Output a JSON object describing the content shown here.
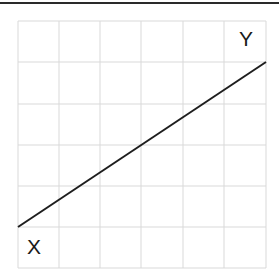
{
  "diagram": {
    "labels": {
      "start": "X",
      "end": "Y"
    },
    "grid": {
      "columns": 6,
      "rows": 6,
      "line_color": "#d9d9d9"
    },
    "line": {
      "color": "#1e1e1e",
      "from": "bottom-left",
      "to": "top-right"
    },
    "top_rule_color": "#2a2a2a"
  }
}
